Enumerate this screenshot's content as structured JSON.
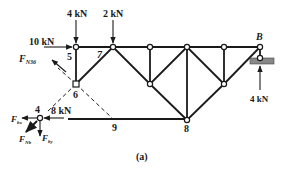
{
  "figure": {
    "caption": "(a)",
    "loads": {
      "top_4kN": "4 kN",
      "top_2kN": "2 kN",
      "horizontal_10kN": "10 kN",
      "horizontal_8kN": "8 kN",
      "support_reaction_4kN": "4 kN"
    },
    "support_label": "B",
    "node_labels": {
      "n4": "4",
      "n5": "5",
      "n6": "6",
      "n7": "7",
      "n8": "8",
      "n9": "9"
    },
    "force_labels": {
      "FN36": {
        "main": "F",
        "sub": "N36"
      },
      "Fbx": {
        "main": "F",
        "sub": "bx"
      },
      "FNb": {
        "main": "F",
        "sub": "Nb"
      },
      "Fby": {
        "main": "F",
        "sub": "by"
      }
    }
  }
}
